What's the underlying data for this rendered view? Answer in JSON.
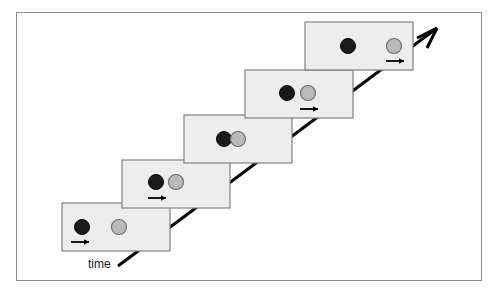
{
  "figure": {
    "kind": "physics-collision-sequence-diagram",
    "background_color": "#ffffff",
    "border_color": "#8c8c8c",
    "frame_fill_color": "#ededed",
    "frame_border_color": "#808080",
    "black_ball_color": "#1a1a1a",
    "grey_ball_color": "#b9b9b9",
    "grey_ball_outline_color": "#6e6e6e",
    "axis_color": "#000000"
  },
  "axis": {
    "label": "time",
    "direction": "diagonal up-right",
    "arrowhead": "open-barbed"
  },
  "frames": [
    {
      "index": 1,
      "caption": "black ball moving right, grey ball at rest",
      "black_ball": {
        "moving": true
      },
      "grey_ball": {
        "moving": false
      },
      "arrow_under": "black"
    },
    {
      "index": 2,
      "caption": "black ball approaching grey ball",
      "black_ball": {
        "moving": true
      },
      "grey_ball": {
        "moving": false
      },
      "arrow_under": "black"
    },
    {
      "index": 3,
      "caption": "balls in contact at the moment of collision",
      "black_ball": {
        "moving": false
      },
      "grey_ball": {
        "moving": false
      },
      "arrow_under": "none"
    },
    {
      "index": 4,
      "caption": "grey ball moving right, black ball at rest",
      "black_ball": {
        "moving": false
      },
      "grey_ball": {
        "moving": true
      },
      "arrow_under": "grey"
    },
    {
      "index": 5,
      "caption": "grey ball continuing right, black ball at rest",
      "black_ball": {
        "moving": false
      },
      "grey_ball": {
        "moving": true
      },
      "arrow_under": "grey"
    }
  ]
}
